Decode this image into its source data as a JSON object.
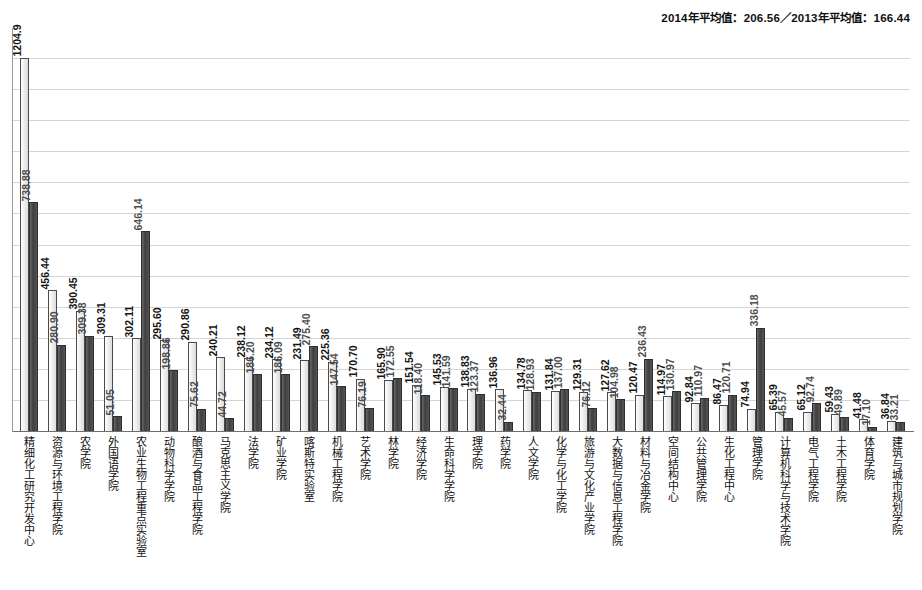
{
  "header": {
    "average_note": "2014年平均值：206.56／2013年平均值：166.44",
    "avg_2014_label": "2014年平均值",
    "avg_2014_value": "206.56",
    "avg_2013_label": "2013年平均值",
    "avg_2013_value": "166.44"
  },
  "chart_data": {
    "type": "bar",
    "title": "",
    "subtitle": "",
    "xlabel": "",
    "ylabel": "",
    "ylim": [
      0,
      1300
    ],
    "grid": true,
    "gridline_values": [
      100,
      200,
      300,
      400,
      500,
      600,
      700,
      800,
      900,
      1000,
      1100,
      1200
    ],
    "legend": "none",
    "orientation": "vertical",
    "grouping": "grouped",
    "categories": [
      "精细化工研究开发中心",
      "资源与环境工程学院",
      "农学院",
      "外国语学院",
      "农业生物工程重点实验室",
      "动物科学学院",
      "酿酒与食品工程学院",
      "马克思主义学院",
      "法学院",
      "矿业学院",
      "喀斯特实验室",
      "机械工程学院",
      "艺术学院",
      "林学院",
      "经济学院",
      "生命科学学院",
      "理学院",
      "药学院",
      "人文学院",
      "化学与化工学院",
      "旅游与文化产业学院",
      "大数据与信息工程学院",
      "材料与冶金学院",
      "空间结构中心",
      "公共管理学院",
      "生化工程中心",
      "管理学院",
      "计算机科学与技术学院",
      "电气工程学院",
      "土木工程学院",
      "体育学院",
      "建筑与城市规划学院"
    ],
    "series": [
      {
        "name": "2014",
        "color": "#efefef",
        "values": [
          1204.9,
          456.44,
          390.45,
          309.31,
          302.11,
          295.6,
          290.86,
          240.21,
          238.12,
          234.12,
          231.49,
          225.36,
          170.7,
          165.9,
          151.54,
          145.53,
          138.83,
          136.96,
          134.78,
          131.84,
          129.31,
          127.62,
          120.47,
          114.97,
          92.84,
          86.47,
          74.94,
          65.39,
          65.12,
          59.43,
          41.48,
          36.84
        ],
        "labels": [
          "1204.9",
          "456.44",
          "390.45",
          "309.31",
          "302.11",
          "295.60",
          "290.86",
          "240.21",
          "238.12",
          "234.12",
          "231.49",
          "225.36",
          "170.70",
          "165.90",
          "151.54",
          "145.53",
          "138.83",
          "136.96",
          "134.78",
          "131.84",
          "129.31",
          "127.62",
          "120.47",
          "114.97",
          "92.84",
          "86.47",
          "74.94",
          "65.39",
          "65.12",
          "59.43",
          "41.48",
          "36.84"
        ]
      },
      {
        "name": "2013",
        "color": "#4d4d4d",
        "values": [
          738.88,
          280.9,
          309.38,
          51.05,
          646.14,
          198.86,
          75.62,
          44.72,
          186.2,
          186.09,
          275.4,
          147.54,
          76.19,
          172.55,
          118.4,
          141.59,
          123.37,
          32.44,
          128.93,
          137.0,
          76.12,
          104.98,
          236.43,
          130.97,
          110.97,
          120.71,
          336.18,
          45.57,
          92.74,
          49.89,
          17.1,
          33.21
        ],
        "labels": [
          "738.88",
          "280.90",
          "309.38",
          "51.05",
          "646.14",
          "198.86",
          "75.62",
          "44.72",
          "186.20",
          "186.09",
          "275.40",
          "147.54",
          "76.19",
          "172.55",
          "118.40",
          "141.59",
          "123.37",
          "32.44",
          "128.93",
          "137.00",
          "76.12",
          "104.98",
          "236.43",
          "130.97",
          "110.97",
          "120.71",
          "336.18",
          "45.57",
          "92.74",
          "49.89",
          "17.10",
          "33.21"
        ]
      }
    ]
  }
}
